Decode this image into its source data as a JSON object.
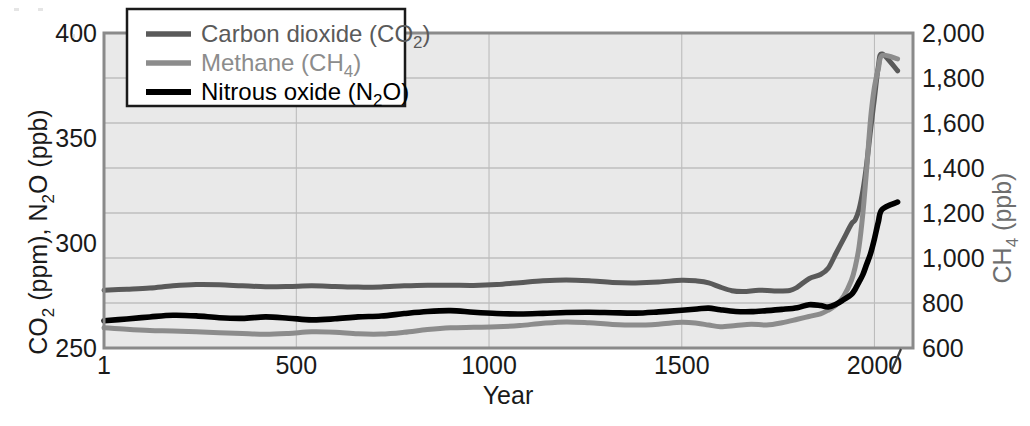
{
  "chart_data": {
    "type": "line",
    "title": "",
    "xlabel": "Year",
    "ylabel_left": "CO2 (ppm), N2O (ppb)",
    "ylabel_right": "CH4 (ppb)",
    "xlim": [
      1,
      2100
    ],
    "ylim_left": [
      250,
      400
    ],
    "ylim_right": [
      600,
      2000
    ],
    "xticks": [
      1,
      500,
      1000,
      1500,
      2000
    ],
    "xticklabels": [
      "1",
      "500",
      "1000",
      "1500",
      "2000"
    ],
    "yticks_left": [
      250,
      300,
      350,
      400
    ],
    "yticklabels_left": [
      "250",
      "300",
      "350",
      "400"
    ],
    "yticks_right": [
      600,
      800,
      1000,
      1200,
      1400,
      1600,
      1800,
      2000
    ],
    "yticklabels_right": [
      "600",
      "800",
      "1,000",
      "1,200",
      "1,400",
      "1,600",
      "1,800",
      "2,000"
    ],
    "grid": true,
    "legend_position": "top-left",
    "plot_bg_color": "#e9e9e9",
    "series": [
      {
        "name": "Carbon dioxide (CO2)",
        "axis": "left",
        "unit": "ppm",
        "color": "#5a5a5a",
        "legend_label_parts": {
          "text": "Carbon dioxide (CO",
          "sub": "2",
          "tail": ")"
        },
        "x": [
          1,
          60,
          120,
          180,
          240,
          300,
          360,
          420,
          480,
          540,
          600,
          660,
          720,
          780,
          840,
          900,
          960,
          1020,
          1080,
          1140,
          1200,
          1260,
          1320,
          1380,
          1440,
          1500,
          1540,
          1570,
          1600,
          1630,
          1660,
          1700,
          1740,
          1780,
          1800,
          1830,
          1860,
          1880,
          1900,
          1920,
          1940,
          1950,
          1960,
          1970,
          1980,
          1990,
          2000,
          2010,
          2020,
          2060
        ],
        "y": [
          277.5,
          278.0,
          278.6,
          279.6,
          280.2,
          280.1,
          279.6,
          279.2,
          279.3,
          279.6,
          279.3,
          279.0,
          279.1,
          279.6,
          279.9,
          279.9,
          279.8,
          280.2,
          281.1,
          282.0,
          282.4,
          282.0,
          281.2,
          281.0,
          281.4,
          282.3,
          281.9,
          281.0,
          279.0,
          277.3,
          276.9,
          277.5,
          277.2,
          277.4,
          279.0,
          283.0,
          285.0,
          288.0,
          295.0,
          302.0,
          309.0,
          311.0,
          316.0,
          325.0,
          338.0,
          354.0,
          369.0,
          384.0,
          390.0,
          382.0
        ]
      },
      {
        "name": "Methane (CH4)",
        "axis": "right",
        "unit": "ppb",
        "color": "#8c8c8c",
        "legend_label_parts": {
          "text": "Methane (CH",
          "sub": "4",
          "tail": ")"
        },
        "x": [
          1,
          60,
          120,
          180,
          240,
          300,
          360,
          420,
          480,
          540,
          600,
          660,
          720,
          780,
          840,
          900,
          960,
          1020,
          1080,
          1140,
          1200,
          1260,
          1320,
          1380,
          1440,
          1500,
          1540,
          1570,
          1600,
          1640,
          1680,
          1720,
          1760,
          1800,
          1830,
          1860,
          1880,
          1900,
          1920,
          1940,
          1950,
          1960,
          1970,
          1980,
          1990,
          2000,
          2010,
          2020,
          2060
        ],
        "y": [
          690,
          683,
          678,
          676,
          672,
          668,
          664,
          661,
          665,
          672,
          670,
          663,
          662,
          670,
          682,
          690,
          692,
          694,
          700,
          710,
          716,
          712,
          705,
          702,
          706,
          714,
          710,
          702,
          695,
          700,
          706,
          702,
          712,
          728,
          740,
          752,
          768,
          790,
          830,
          900,
          960,
          1050,
          1200,
          1400,
          1620,
          1760,
          1840,
          1900,
          1885
        ]
      },
      {
        "name": "Nitrous oxide (N2O)",
        "axis": "left",
        "unit": "ppb",
        "color": "#000000",
        "legend_label_parts": {
          "text": "Nitrous oxide (N",
          "sub": "2",
          "tail": "O)"
        },
        "x": [
          1,
          60,
          120,
          180,
          240,
          300,
          360,
          420,
          480,
          540,
          600,
          660,
          720,
          780,
          840,
          900,
          960,
          1020,
          1080,
          1140,
          1200,
          1260,
          1320,
          1380,
          1440,
          1500,
          1540,
          1570,
          1600,
          1640,
          1680,
          1720,
          1760,
          1800,
          1830,
          1860,
          1880,
          1900,
          1920,
          1940,
          1950,
          1960,
          1970,
          1980,
          1990,
          2000,
          2010,
          2020,
          2060
        ],
        "y": [
          263.0,
          263.8,
          264.8,
          265.6,
          265.3,
          264.4,
          264.1,
          264.8,
          264.2,
          263.4,
          263.9,
          264.8,
          265.2,
          266.4,
          267.4,
          267.8,
          267.0,
          266.4,
          266.2,
          266.5,
          266.9,
          267.0,
          266.8,
          266.6,
          267.2,
          268.0,
          268.6,
          269.0,
          268.2,
          267.4,
          267.3,
          267.8,
          268.4,
          269.2,
          270.6,
          270.2,
          269.5,
          270.8,
          273.0,
          275.5,
          278.0,
          281.5,
          285.0,
          290.0,
          295.0,
          302.0,
          310.0,
          316.0,
          319.5
        ]
      }
    ]
  },
  "legend": {
    "items": [
      {
        "label": "Carbon dioxide (CO2)"
      },
      {
        "label": "Methane (CH4)"
      },
      {
        "label": "Nitrous oxide (N2O)"
      }
    ]
  }
}
